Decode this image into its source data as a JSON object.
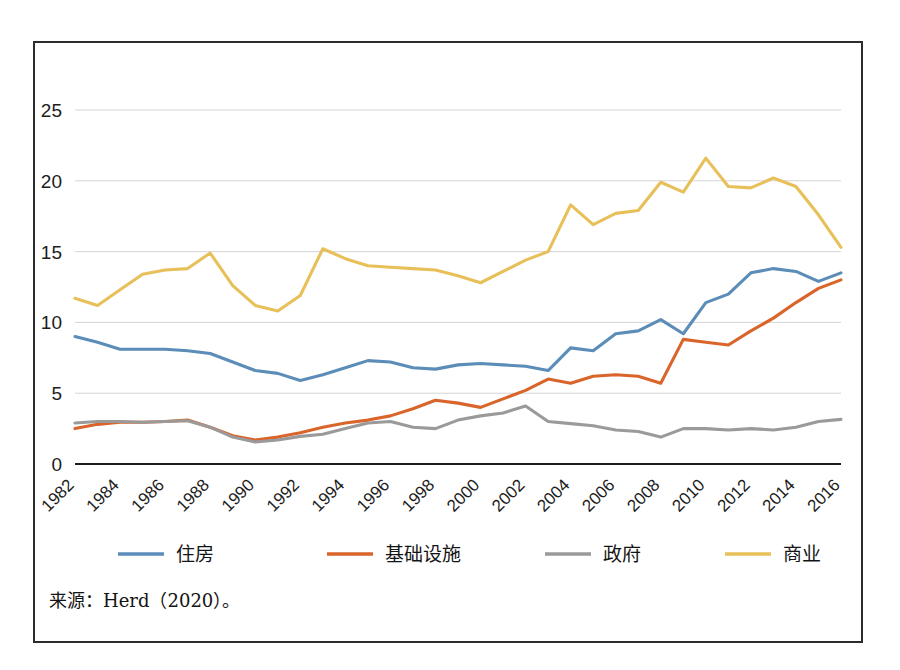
{
  "figure": {
    "source_note": "来源：Herd（2020）。"
  },
  "chart_data": {
    "type": "line",
    "title": "",
    "xlabel": "",
    "ylabel": "",
    "xlim": [
      1982,
      2016
    ],
    "ylim": [
      0,
      25
    ],
    "yticks": [
      0,
      5,
      10,
      15,
      20,
      25
    ],
    "ytick_labels": [
      "0",
      "5",
      "10",
      "15",
      "20",
      "25"
    ],
    "grid": true,
    "legend_position": "bottom",
    "x": [
      1982,
      1983,
      1984,
      1985,
      1986,
      1987,
      1988,
      1989,
      1990,
      1991,
      1992,
      1993,
      1994,
      1995,
      1996,
      1997,
      1998,
      1999,
      2000,
      2001,
      2002,
      2003,
      2004,
      2005,
      2006,
      2007,
      2008,
      2009,
      2010,
      2011,
      2012,
      2013,
      2014,
      2015,
      2016
    ],
    "xtick_values": [
      1982,
      1984,
      1986,
      1988,
      1990,
      1992,
      1994,
      1996,
      1998,
      2000,
      2002,
      2004,
      2006,
      2008,
      2010,
      2012,
      2014,
      2016
    ],
    "xtick_labels": [
      "1982",
      "1984",
      "1986",
      "1988",
      "1990",
      "1992",
      "1994",
      "1996",
      "1998",
      "2000",
      "2002",
      "2004",
      "2006",
      "2008",
      "2010",
      "2012",
      "2014",
      "2016"
    ],
    "series": [
      {
        "name": "住房",
        "color": "#5B8DB8",
        "values": [
          9.0,
          8.6,
          8.1,
          8.1,
          8.1,
          8.0,
          7.8,
          7.2,
          6.6,
          6.4,
          5.9,
          6.3,
          6.8,
          7.3,
          7.2,
          6.8,
          6.7,
          7.0,
          7.1,
          7.0,
          6.9,
          6.6,
          8.2,
          8.0,
          9.2,
          9.4,
          10.2,
          9.2,
          11.4,
          12.0,
          13.5,
          13.8,
          13.6,
          12.9,
          13.5
        ]
      },
      {
        "name": "基础设施",
        "color": "#D9652B",
        "values": [
          2.5,
          2.8,
          2.95,
          2.95,
          3.0,
          3.1,
          2.6,
          2.0,
          1.7,
          1.9,
          2.2,
          2.6,
          2.9,
          3.1,
          3.4,
          3.9,
          4.5,
          4.3,
          4.0,
          4.6,
          5.2,
          6.0,
          5.7,
          6.2,
          6.3,
          6.2,
          5.7,
          8.8,
          8.6,
          8.4,
          9.4,
          10.3,
          11.4,
          12.4,
          13.0
        ]
      },
      {
        "name": "政府",
        "color": "#9A9A9A",
        "values": [
          2.9,
          3.0,
          3.0,
          2.95,
          3.0,
          3.05,
          2.6,
          1.9,
          1.55,
          1.7,
          1.95,
          2.1,
          2.5,
          2.9,
          3.0,
          2.6,
          2.5,
          3.1,
          3.4,
          3.6,
          4.1,
          3.0,
          2.85,
          2.7,
          2.4,
          2.3,
          1.9,
          2.5,
          2.5,
          2.4,
          2.5,
          2.4,
          2.6,
          3.0,
          3.15
        ]
      },
      {
        "name": "商业",
        "color": "#E8C05A",
        "values": [
          11.7,
          11.2,
          12.3,
          13.4,
          13.7,
          13.8,
          14.9,
          12.6,
          11.2,
          10.8,
          11.9,
          15.2,
          14.5,
          14.0,
          13.9,
          13.8,
          13.7,
          13.3,
          12.8,
          13.6,
          14.4,
          15.0,
          18.3,
          16.9,
          17.7,
          17.9,
          19.9,
          19.2,
          21.6,
          19.6,
          19.5,
          20.2,
          19.6,
          17.6,
          15.3
        ]
      }
    ]
  }
}
